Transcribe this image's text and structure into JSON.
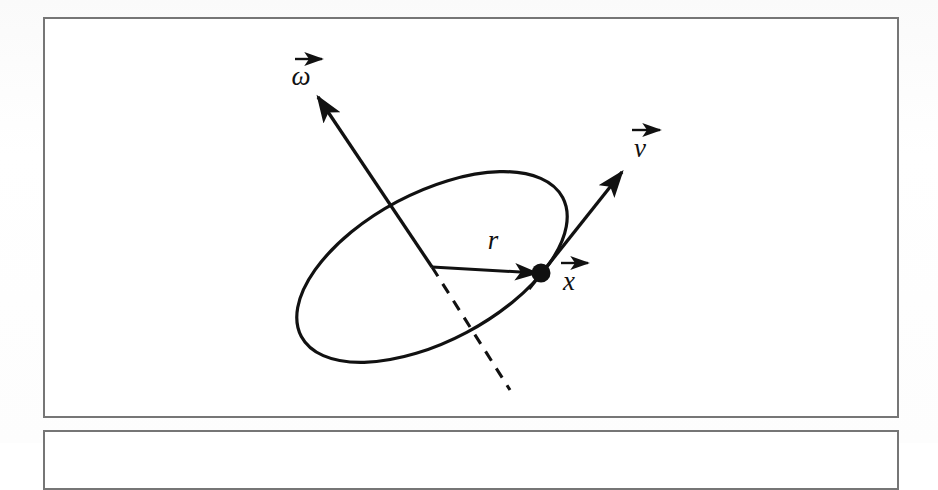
{
  "figure": {
    "background_color": "#ffffff",
    "ink_color": "#111111",
    "frame_color": "#767676",
    "labels": {
      "omega": "ω",
      "velocity": "v",
      "position": "x",
      "radius": "r",
      "overarrow": "→"
    },
    "elements": {
      "disk": "ellipse-disk",
      "rotation_axis_visible": "omega-arrow",
      "rotation_axis_hidden": "dashed-axis",
      "rim_point": "point-dot",
      "radius_arrow": "r-arrow",
      "velocity_arrow": "v-arrow"
    },
    "geometry": {
      "ellipse_center_x": 389,
      "ellipse_center_y": 250,
      "ellipse_rx": 148,
      "ellipse_ry": 74,
      "ellipse_rotation_deg": -28,
      "point_x": 498,
      "point_y": 256,
      "point_radius": 9,
      "omega_tip_x": 275,
      "omega_tip_y": 80,
      "v_tip_x": 579,
      "v_tip_y": 155,
      "dash_end_x": 467,
      "dash_end_y": 373
    },
    "bleed_through": {
      "top_line": "ıııı ııııı ııııııı ııı",
      "right_line": "ııııııı"
    }
  }
}
